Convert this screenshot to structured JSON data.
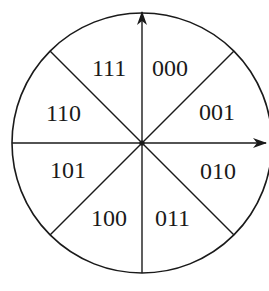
{
  "diagram": {
    "type": "sector-code-wheel",
    "stroke_color": "#1a1a1a",
    "background": "#ffffff",
    "center": [
      142,
      143
    ],
    "radius": 130,
    "axes": {
      "vertical": {
        "direction": "up",
        "arrow": true
      },
      "horizontal": {
        "direction": "right",
        "arrow": true
      }
    },
    "sectors": [
      {
        "position": "top-right",
        "code": "000"
      },
      {
        "position": "right-upper",
        "code": "001"
      },
      {
        "position": "right-lower",
        "code": "010"
      },
      {
        "position": "bottom-right",
        "code": "011"
      },
      {
        "position": "bottom-left",
        "code": "100"
      },
      {
        "position": "left-lower",
        "code": "101"
      },
      {
        "position": "left-upper",
        "code": "110"
      },
      {
        "position": "top-left",
        "code": "111"
      }
    ]
  }
}
